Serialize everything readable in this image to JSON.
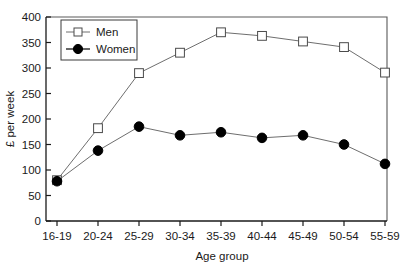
{
  "chart_data": {
    "type": "line",
    "title": "",
    "subtitle": "",
    "xlabel": "Age group",
    "ylabel": "£ per week",
    "categories": [
      "16-19",
      "20-24",
      "25-29",
      "30-34",
      "35-39",
      "40-44",
      "45-49",
      "50-54",
      "55-59"
    ],
    "series": [
      {
        "name": "Men",
        "marker": "open-square",
        "values": [
          80,
          182,
          290,
          330,
          370,
          363,
          352,
          341,
          291
        ]
      },
      {
        "name": "Women",
        "marker": "filled-circle",
        "values": [
          78,
          138,
          185,
          168,
          174,
          163,
          168,
          150,
          112
        ]
      }
    ],
    "ylim": [
      0,
      400
    ],
    "yticks": [
      0,
      50,
      100,
      150,
      200,
      250,
      300,
      350,
      400
    ],
    "ytick_labels": [
      "0",
      "50",
      "100",
      "150",
      "200",
      "250",
      "300",
      "350",
      "400"
    ],
    "grid": false,
    "legend_position": "top-left-inside",
    "colors": {
      "men_line": "#6e6e6e",
      "men_marker_fill": "#ffffff",
      "men_marker_stroke": "#4a4a4a",
      "women_line": "#6e6e6e",
      "women_marker_fill": "#000000",
      "axis": "#1a1a1a",
      "frame": "#5a5a5a",
      "background": "#ffffff"
    }
  },
  "legend": {
    "entries": [
      {
        "label": "Men"
      },
      {
        "label": "Women"
      }
    ]
  },
  "axes": {
    "x_title": "Age group",
    "y_title": "£ per week"
  }
}
